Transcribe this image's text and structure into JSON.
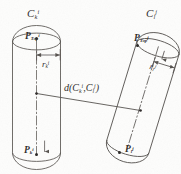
{
  "figure": {
    "background_color": "#fdfdfc",
    "ink_color": "#2e2c2b",
    "line_color": "#55514e"
  },
  "capsule_left": {
    "name_label": "C",
    "name_sub": "k",
    "name_sup": "i",
    "top_point_label": "P",
    "top_point_sub": "Top",
    "top_point_sup": "i",
    "bottom_point_label": "P",
    "bottom_point_sub": "k",
    "bottom_point_sup": "i",
    "radius_label": "r",
    "radius_sub": "k",
    "radius_sup": "i",
    "orientation_degrees": 0
  },
  "capsule_right": {
    "name_label": "C",
    "name_sub": "l",
    "name_sup": "j",
    "top_point_label": "P",
    "top_point_sub": "Top",
    "top_point_sup": "j",
    "bottom_point_label": "P",
    "bottom_point_sub": "l",
    "bottom_point_sup": "j",
    "radius_label": "r",
    "radius_sub": "l",
    "radius_sup": "j",
    "orientation_degrees": 17
  },
  "distance": {
    "fn": "d",
    "open": "(",
    "arg1": "C",
    "arg1_sub": "k",
    "arg1_sup": "i",
    "comma": ",",
    "arg2": "C",
    "arg2_sub": "l",
    "arg2_sup": "j",
    "close": ")"
  }
}
